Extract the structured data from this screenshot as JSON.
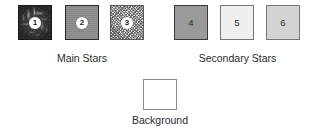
{
  "figure": {
    "type": "legend-swatch-figure",
    "background_color": "#ffffff"
  },
  "groups": [
    {
      "id": "main-stars",
      "caption": "Main Stars",
      "swatches": [
        {
          "number": "1",
          "texture": "dark-mottled-streaks",
          "fill_color": "#2f2f2f",
          "border_color": "#1a1a1a",
          "badge": true
        },
        {
          "number": "2",
          "texture": "solid",
          "fill_color": "#8d8d8d",
          "border_color": "#2a2a2a",
          "badge": true
        },
        {
          "number": "3",
          "texture": "fine-speckle-noise",
          "fill_color": "#dcdcdc",
          "border_color": "#5a5a5a",
          "badge": true
        }
      ]
    },
    {
      "id": "secondary-stars",
      "caption": "Secondary Stars",
      "swatches": [
        {
          "number": "4",
          "texture": "solid",
          "fill_color": "#9a9a9a",
          "border_color": "#3a3a3a",
          "badge": false
        },
        {
          "number": "5",
          "texture": "solid",
          "fill_color": "#efefef",
          "border_color": "#777777",
          "badge": false
        },
        {
          "number": "6",
          "texture": "solid",
          "fill_color": "#d3d3d3",
          "border_color": "#777777",
          "badge": false
        }
      ]
    }
  ],
  "background_swatch": {
    "caption": "Background",
    "fill_color": "#ffffff",
    "border_color": "#8a8a8a"
  }
}
